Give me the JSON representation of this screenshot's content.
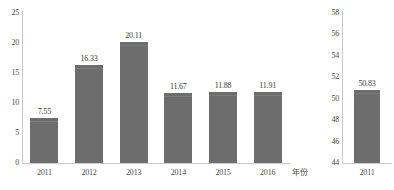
{
  "figure": {
    "background": "#ffffff",
    "bar_color": "#6d6d6d",
    "axis_color": "#c9c9c9",
    "text_color": "#3a3a3a"
  },
  "left_panel": {
    "x_axis_title": "年份",
    "y_ticks": [
      "0",
      "5",
      "10",
      "15",
      "20",
      "25"
    ],
    "categories": [
      "2011",
      "2012",
      "2013",
      "2014",
      "2015",
      "2016"
    ],
    "values": [
      "7.55",
      "16.33",
      "20.11",
      "11.67",
      "11.88",
      "11.91"
    ]
  },
  "right_panel": {
    "y_ticks": [
      "44",
      "46",
      "48",
      "50",
      "52",
      "54",
      "56",
      "58"
    ],
    "categories": [
      "2011"
    ],
    "values": [
      "50.83"
    ]
  },
  "chart_data": [
    {
      "type": "bar",
      "panel": "left",
      "title": "",
      "xlabel": "年份",
      "ylabel": "",
      "categories": [
        "2011",
        "2012",
        "2013",
        "2014",
        "2015",
        "2016"
      ],
      "values": [
        7.55,
        16.33,
        20.11,
        11.67,
        11.88,
        11.91
      ],
      "data_labels": [
        "7.55",
        "16.33",
        "20.11",
        "11.67",
        "11.88",
        "11.91"
      ],
      "ylim": [
        0,
        25
      ],
      "ytick_values": [
        0,
        5,
        10,
        15,
        20,
        25
      ],
      "ytick_labels": [
        "0",
        "5",
        "10",
        "15",
        "20",
        "25"
      ],
      "grid": false,
      "legend": null
    },
    {
      "type": "bar",
      "panel": "right",
      "title": "",
      "xlabel": "",
      "ylabel": "",
      "categories": [
        "2011"
      ],
      "values": [
        50.83
      ],
      "data_labels": [
        "50.83"
      ],
      "ylim": [
        44,
        58
      ],
      "ytick_values": [
        44,
        46,
        48,
        50,
        52,
        54,
        56,
        58
      ],
      "ytick_labels": [
        "44",
        "46",
        "48",
        "50",
        "52",
        "54",
        "56",
        "58"
      ],
      "grid": false,
      "legend": null
    }
  ]
}
